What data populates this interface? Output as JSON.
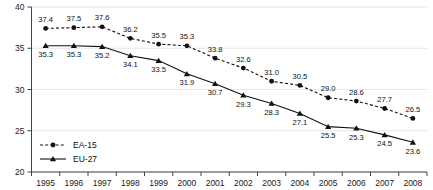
{
  "chart_data": {
    "type": "line",
    "title": "",
    "subtitle": "",
    "xlabel": "",
    "ylabel": "",
    "grid": true,
    "legend_position": "bottom-left",
    "categories": [
      "1995",
      "1996",
      "1997",
      "1998",
      "1999",
      "2000",
      "2001",
      "2002",
      "2003",
      "2004",
      "2005",
      "2006",
      "2007",
      "2008"
    ],
    "x": [
      1995,
      1996,
      1997,
      1998,
      1999,
      2000,
      2001,
      2002,
      2003,
      2004,
      2005,
      2006,
      2007,
      2008
    ],
    "xlim": [
      1994.5,
      2008.5
    ],
    "ylim": [
      20,
      40
    ],
    "yticks": [
      20,
      25,
      30,
      35,
      40
    ],
    "ytick_labels": [
      "20",
      "25",
      "30",
      "35",
      "40"
    ],
    "series": [
      {
        "name": "EA-15",
        "marker": "circle",
        "linestyle": "dashed",
        "color": "#111111",
        "label_position": "above",
        "values": [
          37.4,
          37.5,
          37.6,
          36.2,
          35.5,
          35.3,
          33.8,
          32.6,
          31.0,
          30.5,
          29.0,
          28.6,
          27.7,
          26.5
        ],
        "value_labels": [
          "37.4",
          "37.5",
          "37.6",
          "36.2",
          "35.5",
          "35.3",
          "33.8",
          "32.6",
          "31.0",
          "30.5",
          "29.0",
          "28.6",
          "27.7",
          "26.5"
        ]
      },
      {
        "name": "EU-27",
        "marker": "triangle",
        "linestyle": "solid",
        "color": "#111111",
        "label_position": "below",
        "values": [
          35.3,
          35.3,
          35.2,
          34.1,
          33.5,
          31.9,
          30.7,
          29.3,
          28.3,
          27.1,
          25.5,
          25.3,
          24.5,
          23.6
        ],
        "value_labels": [
          "35.3",
          "35.3",
          "35.2",
          "34.1",
          "33.5",
          "31.9",
          "30.7",
          "29.3",
          "28.3",
          "27.1",
          "25.5",
          "25.3",
          "24.5",
          "23.6"
        ]
      }
    ],
    "legend": [
      {
        "label": "EA-15",
        "marker": "circle",
        "linestyle": "dashed"
      },
      {
        "label": "EU-27",
        "marker": "triangle",
        "linestyle": "solid"
      }
    ]
  },
  "colors": {
    "axis": "#444444",
    "grid": "#e6e6e6",
    "series": "#111111",
    "text": "#111111",
    "background": "#ffffff"
  }
}
